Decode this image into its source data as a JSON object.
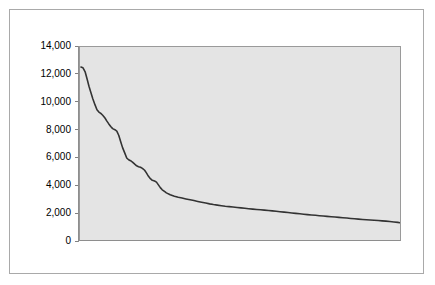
{
  "figure": {
    "background_color": "#ffffff",
    "frame_color": "#a9a9a9",
    "plot_background_color": "#e4e4e4",
    "plot_border_color": "#9a9a9a",
    "line_color": "#333333"
  },
  "axis": {
    "y_tick_labels": [
      "14,000",
      "12,000",
      "10,000",
      "8,000",
      "6,000",
      "4,000",
      "2,000",
      "0"
    ],
    "y_tick_values": [
      14000,
      12000,
      10000,
      8000,
      6000,
      4000,
      2000,
      0
    ],
    "x_tick_labels": []
  },
  "chart_data": {
    "type": "line",
    "title": "",
    "subtitle": "",
    "xlabel": "",
    "ylabel": "",
    "xlim": [
      0,
      100
    ],
    "ylim": [
      0,
      14000
    ],
    "grid": false,
    "legend": false,
    "legend_position": "none",
    "y_ticks": [
      0,
      2000,
      4000,
      6000,
      8000,
      10000,
      12000,
      14000
    ],
    "y_tick_labels": [
      "0",
      "2,000",
      "4,000",
      "6,000",
      "8,000",
      "10,000",
      "12,000",
      "14,000"
    ],
    "x_ticks": [],
    "x_tick_labels": [],
    "annotations": [],
    "series": [
      {
        "name": "frequency",
        "x": [
          0.3,
          0.9,
          1.6,
          2.2,
          2.8,
          3.4,
          4.0,
          4.7,
          5.3,
          5.9,
          6.5,
          7.1,
          7.8,
          8.4,
          9.0,
          9.6,
          10.2,
          10.9,
          11.5,
          12.1,
          12.7,
          13.3,
          14.0,
          14.6,
          15.2,
          15.8,
          16.4,
          17.1,
          17.7,
          18.3,
          18.9,
          19.5,
          20.2,
          20.8,
          21.4,
          22.0,
          22.6,
          23.3,
          23.9,
          24.5,
          25.1,
          25.7,
          26.4,
          27.0,
          28.2,
          29.5,
          30.7,
          31.9,
          33.1,
          34.4,
          35.6,
          36.8,
          38.0,
          39.3,
          40.5,
          41.7,
          42.9,
          44.2,
          45.4,
          46.6,
          47.8,
          49.1,
          50.3,
          51.5,
          52.7,
          54.0,
          55.2,
          56.4,
          57.6,
          58.9,
          60.1,
          61.3,
          62.5,
          63.8,
          65.0,
          66.2,
          67.4,
          68.7,
          69.9,
          71.1,
          72.3,
          73.6,
          74.8,
          76.0,
          77.2,
          78.5,
          79.7,
          80.9,
          82.1,
          83.4,
          84.6,
          85.8,
          87.0,
          88.3,
          89.5,
          90.7,
          91.9,
          93.2,
          94.4,
          95.6,
          96.8,
          98.1,
          99.3,
          100.0
        ],
        "y": [
          12550,
          12500,
          12200,
          11700,
          11150,
          10700,
          10250,
          9800,
          9450,
          9280,
          9180,
          9050,
          8850,
          8620,
          8420,
          8230,
          8080,
          8000,
          7900,
          7600,
          7150,
          6700,
          6300,
          5950,
          5820,
          5750,
          5650,
          5500,
          5380,
          5320,
          5280,
          5200,
          5060,
          4850,
          4620,
          4450,
          4330,
          4280,
          4200,
          4000,
          3800,
          3640,
          3520,
          3420,
          3280,
          3180,
          3100,
          3040,
          2980,
          2920,
          2860,
          2800,
          2740,
          2680,
          2620,
          2570,
          2530,
          2490,
          2450,
          2420,
          2390,
          2360,
          2330,
          2300,
          2270,
          2240,
          2215,
          2190,
          2165,
          2140,
          2110,
          2080,
          2050,
          2020,
          1990,
          1960,
          1930,
          1900,
          1870,
          1840,
          1815,
          1790,
          1765,
          1740,
          1715,
          1690,
          1665,
          1640,
          1615,
          1590,
          1565,
          1540,
          1515,
          1490,
          1470,
          1450,
          1430,
          1410,
          1390,
          1370,
          1340,
          1310,
          1280,
          1250
        ]
      }
    ]
  }
}
